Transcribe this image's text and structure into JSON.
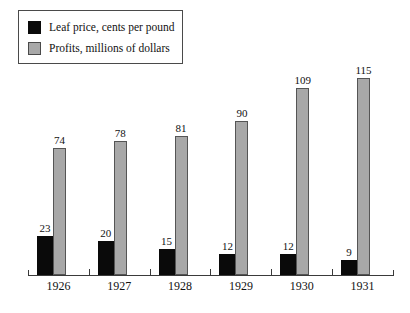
{
  "chart_data": {
    "type": "bar",
    "title": "",
    "subtitle": "",
    "xlabel": "",
    "ylabel": "",
    "categories": [
      "1926",
      "1927",
      "1928",
      "1929",
      "1930",
      "1931"
    ],
    "series": [
      {
        "name": "Leaf price, cents per pound",
        "color": "#0a0a0a",
        "values": [
          23,
          20,
          15,
          12,
          12,
          9
        ]
      },
      {
        "name": "Profits, millions of dollars",
        "color": "#a8a8a8",
        "values": [
          74,
          78,
          81,
          90,
          109,
          115
        ]
      }
    ],
    "ylim": [
      0,
      120
    ],
    "grid": false,
    "legend_position": "top-left",
    "data_labels": true,
    "axis": {
      "baseline_only": true,
      "tick_count": 7
    }
  },
  "legend": {
    "items": [
      {
        "label": "Leaf price, cents per pound",
        "swatch": "black-swatch"
      },
      {
        "label": "Profits, millions of dollars",
        "swatch": "gray-swatch"
      }
    ]
  }
}
